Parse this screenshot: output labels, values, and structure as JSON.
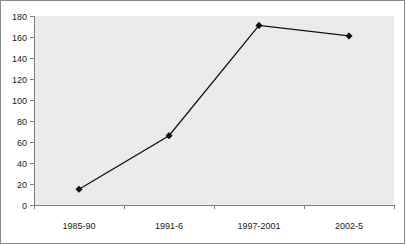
{
  "chart_data": {
    "type": "line",
    "title": "",
    "subtitle": "",
    "xlabel": "",
    "ylabel": "",
    "categories": [
      "1985-90",
      "1991-6",
      "1997-2001",
      "2002-5"
    ],
    "values": [
      15,
      66,
      171,
      161
    ],
    "series": [
      {
        "name": "",
        "values": [
          15,
          66,
          171,
          161
        ]
      }
    ],
    "ylim": [
      0,
      180
    ],
    "ytick_step": 20,
    "yticks": [
      0,
      20,
      40,
      60,
      80,
      100,
      120,
      140,
      160,
      180
    ],
    "ytick_labels": [
      "0",
      "20",
      "40",
      "60",
      "80",
      "100",
      "120",
      "140",
      "160",
      "180"
    ],
    "grid": false,
    "legend": false,
    "legend_position": "none",
    "marker": "diamond",
    "colors": {
      "line": "#101010",
      "marker": "#101010",
      "plot_background": "#ebebeb",
      "page_background": "#ffffff",
      "axis": "#7d7d7d",
      "frame_border": "#8a8a8a",
      "tick_text": "#1a1a1a"
    }
  }
}
